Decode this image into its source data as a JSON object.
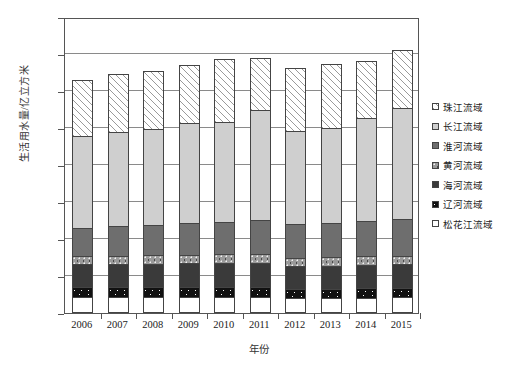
{
  "chart_data": {
    "type": "bar",
    "stacked": true,
    "title": "",
    "xlabel": "年份",
    "ylabel": "生活用水量/亿立方米",
    "ylim": [
      0,
      800
    ],
    "ytick_step": 100,
    "yticks": [
      0,
      100,
      200,
      300,
      400,
      500,
      600,
      700,
      800
    ],
    "grid": true,
    "legend_position": "right",
    "categories": [
      "2006",
      "2007",
      "2008",
      "2009",
      "2010",
      "2011",
      "2012",
      "2013",
      "2014",
      "2015"
    ],
    "series": [
      {
        "name": "松花江流域",
        "key": "songhua",
        "pattern": "solid-white",
        "color": "#ffffff",
        "values": [
          38,
          38,
          38,
          38,
          38,
          38,
          36,
          36,
          36,
          37
        ]
      },
      {
        "name": "辽河流域",
        "key": "liao",
        "pattern": "dark-speckle",
        "color": "#111111",
        "values": [
          26,
          26,
          26,
          26,
          26,
          26,
          24,
          24,
          25,
          25
        ]
      },
      {
        "name": "海河流域",
        "key": "hai",
        "pattern": "solid-dark-gray",
        "color": "#3a3a3a",
        "values": [
          62,
          63,
          64,
          65,
          66,
          67,
          62,
          63,
          64,
          65
        ]
      },
      {
        "name": "黄河流域",
        "key": "huang",
        "pattern": "dotted-gray",
        "color": "#9a9a9a",
        "values": [
          22,
          22,
          23,
          23,
          24,
          24,
          22,
          22,
          23,
          23
        ]
      },
      {
        "name": "淮河流域",
        "key": "huai",
        "pattern": "solid-mid-gray",
        "color": "#6e6e6e",
        "values": [
          77,
          80,
          82,
          85,
          88,
          92,
          90,
          92,
          95,
          100
        ]
      },
      {
        "name": "长江流域",
        "key": "chang",
        "pattern": "solid-light-gray",
        "color": "#cfcfcf",
        "values": [
          249,
          254,
          259,
          271,
          268,
          296,
          253,
          258,
          278,
          300
        ]
      },
      {
        "name": "珠江流域",
        "key": "zhu",
        "pattern": "diagonal-hatch",
        "color": "#ffffff",
        "values": [
          151,
          157,
          158,
          157,
          170,
          140,
          169,
          172,
          154,
          156
        ]
      }
    ],
    "totals": [
      625,
      640,
      650,
      665,
      680,
      683,
      656,
      667,
      675,
      706
    ]
  },
  "axis": {
    "y_title": "生活用水量/亿立方米",
    "x_title": "年份"
  }
}
